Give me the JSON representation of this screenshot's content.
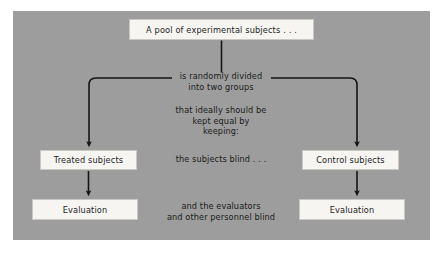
{
  "figure": {
    "type": "flowchart",
    "colors": {
      "panel_background": "#9d9d9d",
      "box_fill": "#f6f5f2",
      "box_border": "#c9c8c4",
      "line": "#141414",
      "text": "#1b1b1b",
      "page_background": "#ffffff"
    }
  },
  "boxes": {
    "pool": "A pool of experimental subjects . . .",
    "treated": "Treated subjects",
    "control": "Control subjects",
    "evaluation_left": "Evaluation",
    "evaluation_right": "Evaluation"
  },
  "labels": {
    "divided_line1": "is randomly divided",
    "divided_line2": "into two groups",
    "equal_line1": "that ideally should be",
    "equal_line2": "kept equal by",
    "equal_line3": "keeping:",
    "blind": "the subjects blind . . .",
    "evaluators_line1": "and the evaluators",
    "evaluators_line2": "and other personnel blind"
  }
}
